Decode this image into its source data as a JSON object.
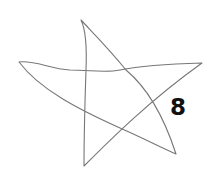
{
  "figure": {
    "shape": "hand-drawn-star",
    "stroke_color": "#777777",
    "background": "#ffffff",
    "label": "8",
    "label_color": "#111111"
  }
}
